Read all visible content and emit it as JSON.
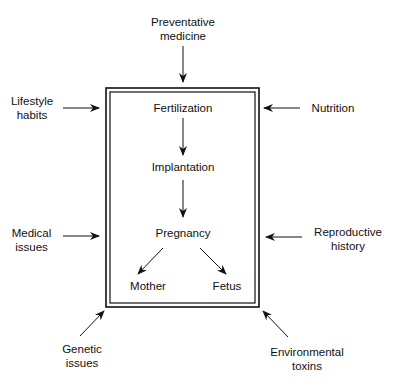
{
  "diagram": {
    "external_factors": {
      "top": "Preventative\nmedicine",
      "left_top": "Lifestyle\nhabits",
      "right_top": "Nutrition",
      "left_mid": "Medical\nissues",
      "right_mid": "Reproductive\nhistory",
      "bottom_left": "Genetic\nissues",
      "bottom_right": "Environmental\ntoxins"
    },
    "stages": {
      "s1": "Fertilization",
      "s2": "Implantation",
      "s3": "Pregnancy",
      "out_left": "Mother",
      "out_right": "Fetus"
    }
  }
}
